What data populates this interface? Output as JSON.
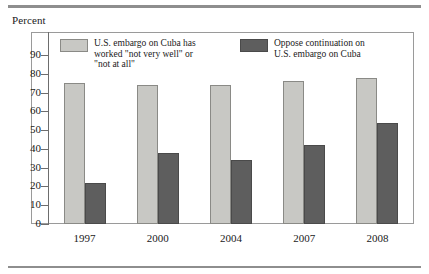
{
  "figure": {
    "axis_title": "Percent",
    "rule_color": "#8e8e8e"
  },
  "legend": {
    "position": "inside-top",
    "entries": [
      {
        "key": "series1",
        "swatch": "light-gray-swatch",
        "label": "U.S. embargo on Cuba has\nworked \"not very well\" or\n\"not at all\"",
        "color": "#c8c8c4"
      },
      {
        "key": "series2",
        "swatch": "dark-gray-swatch",
        "label": "Oppose continuation on\nU.S. embargo on Cuba",
        "color": "#5e5e5e"
      }
    ]
  },
  "chart_data": {
    "type": "bar",
    "title": "",
    "subtitle": "",
    "xlabel": "",
    "ylabel": "Percent",
    "ylim": [
      0,
      95
    ],
    "yticks": [
      0,
      10,
      20,
      30,
      40,
      50,
      60,
      70,
      80,
      90
    ],
    "ytick_labels": [
      "0",
      "10",
      "20",
      "30",
      "40",
      "50",
      "60",
      "70",
      "80",
      "90"
    ],
    "grid": false,
    "legend_position": "inside top",
    "categories": [
      "1997",
      "2000",
      "2004",
      "2007",
      "2008"
    ],
    "series": [
      {
        "name": "U.S. embargo on Cuba has worked \"not very well\" or \"not at all\"",
        "color": "#c8c8c4",
        "values": [
          75,
          74,
          74,
          76,
          78
        ]
      },
      {
        "name": "Oppose continuation on U.S. embargo on Cuba",
        "color": "#5e5e5e",
        "values": [
          22,
          38,
          34,
          42,
          54
        ]
      }
    ]
  }
}
